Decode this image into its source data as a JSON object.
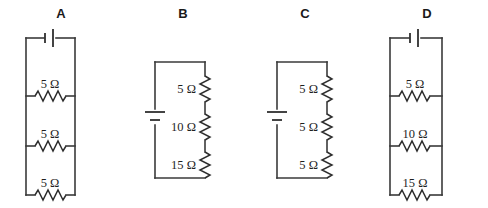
{
  "figure": {
    "title": "",
    "background_color": "#ffffff",
    "line_color": "#3a3a3a",
    "text_color": "#1f1f1f"
  },
  "circuits": [
    {
      "label": "A",
      "topology": "parallel",
      "source": "battery",
      "source_position": "top",
      "resistor_orientation": "horizontal",
      "resistors": [
        {
          "value": "5 Ω"
        },
        {
          "value": "5 Ω"
        },
        {
          "value": "5 Ω"
        }
      ]
    },
    {
      "label": "B",
      "topology": "series",
      "source": "battery",
      "source_position": "left",
      "resistor_orientation": "vertical",
      "resistors": [
        {
          "value": "5 Ω"
        },
        {
          "value": "10 Ω"
        },
        {
          "value": "15 Ω"
        }
      ]
    },
    {
      "label": "C",
      "topology": "series",
      "source": "battery",
      "source_position": "left",
      "resistor_orientation": "vertical",
      "resistors": [
        {
          "value": "5 Ω"
        },
        {
          "value": "5 Ω"
        },
        {
          "value": "5 Ω"
        }
      ]
    },
    {
      "label": "D",
      "topology": "parallel",
      "source": "battery",
      "source_position": "top",
      "resistor_orientation": "horizontal",
      "resistors": [
        {
          "value": "5 Ω"
        },
        {
          "value": "10 Ω"
        },
        {
          "value": "15 Ω"
        }
      ]
    }
  ]
}
